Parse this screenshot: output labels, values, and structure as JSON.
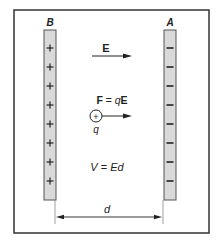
{
  "diagram": {
    "plate_left": {
      "label": "B",
      "sign": "+",
      "count": 8
    },
    "plate_right": {
      "label": "A",
      "sign": "−",
      "count": 8
    },
    "field_label": "E",
    "force_equation": "F = qE",
    "force_parts": {
      "F": "F",
      "eq": " = ",
      "q": "q",
      "E": "E"
    },
    "charge_symbol": "+",
    "charge_label": "q",
    "voltage_equation": "V = Ed",
    "voltage_parts": {
      "V": "V",
      "eq": " = ",
      "Ed": "Ed"
    },
    "distance_label": "d",
    "colors": {
      "plate_fill": "#d9d9d9",
      "plate_stroke": "#555555",
      "border": "#333333",
      "ink": "#222222"
    }
  }
}
